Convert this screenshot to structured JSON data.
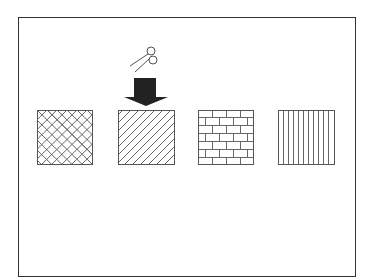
{
  "diagram": {
    "title": "",
    "patterns": [
      {
        "name": "crosshatch-diagonal",
        "selected": false
      },
      {
        "name": "diagonal-lines",
        "selected": true
      },
      {
        "name": "brick",
        "selected": false
      },
      {
        "name": "vertical-lines",
        "selected": false
      }
    ],
    "indicator": {
      "icon": "scissors-icon",
      "pointer": "down-arrow",
      "target_index": 1
    },
    "colors": {
      "stroke": "#555555",
      "arrow": "#222222",
      "frame": "#333333"
    }
  }
}
